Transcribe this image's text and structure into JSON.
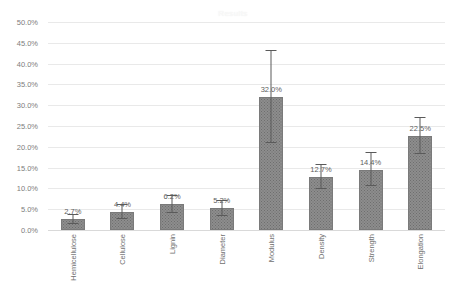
{
  "chart_data": {
    "type": "bar",
    "title": "Results",
    "xlabel": "",
    "ylabel": "",
    "categories": [
      "Hemicellulose",
      "Cellulose",
      "Lignin",
      "Diameter",
      "Modulus",
      "Density",
      "Strength",
      "Elongation"
    ],
    "values": [
      2.7,
      4.4,
      6.2,
      5.2,
      32.0,
      12.7,
      14.4,
      22.5
    ],
    "data_labels": [
      "2.7%",
      "4.4%",
      "6.2%",
      "5.2%",
      "32.0%",
      "12.7%",
      "14.4%",
      "22.5%"
    ],
    "error_low": [
      1.4,
      2.6,
      4.1,
      3.4,
      21.0,
      9.8,
      10.6,
      18.2
    ],
    "error_high": [
      3.6,
      6.0,
      8.1,
      7.0,
      43.0,
      15.6,
      18.6,
      27.0
    ],
    "ylim": [
      0,
      50
    ],
    "ytick_values": [
      0,
      5,
      10,
      15,
      20,
      25,
      30,
      35,
      40,
      45,
      50
    ],
    "ytick_labels": [
      "0.0%",
      "5.0%",
      "10.0%",
      "15.0%",
      "20.0%",
      "25.0%",
      "30.0%",
      "35.0%",
      "40.0%",
      "45.0%",
      "50.0%"
    ],
    "grid": true,
    "legend": false,
    "bar_color": "#8d8d8d",
    "grid_color": "#e9e9e9",
    "text_color": "#6f6f6f"
  }
}
